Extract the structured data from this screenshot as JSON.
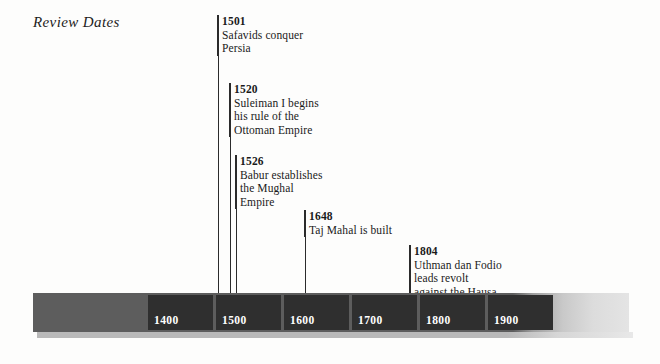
{
  "title": "Review Dates",
  "timeline": {
    "decade_labels": [
      "1400",
      "1500",
      "1600",
      "1700",
      "1800",
      "1900"
    ],
    "bar_color": "#2f2f2f",
    "bar_background_color": "#5d5d5d",
    "label_color": "#ffffff"
  },
  "events": [
    {
      "year": "1501",
      "lines": [
        "Safavids conquer",
        "Persia"
      ]
    },
    {
      "year": "1520",
      "lines": [
        "Suleiman I begins",
        "his rule of the",
        "Ottoman Empire"
      ]
    },
    {
      "year": "1526",
      "lines": [
        "Babur establishes",
        "the Mughal",
        "Empire"
      ]
    },
    {
      "year": "1648",
      "lines": [
        "Taj Mahal is built"
      ]
    },
    {
      "year": "1804",
      "lines": [
        "Uthman dan Fodio",
        "leads revolt",
        "against the Hausa"
      ]
    }
  ]
}
